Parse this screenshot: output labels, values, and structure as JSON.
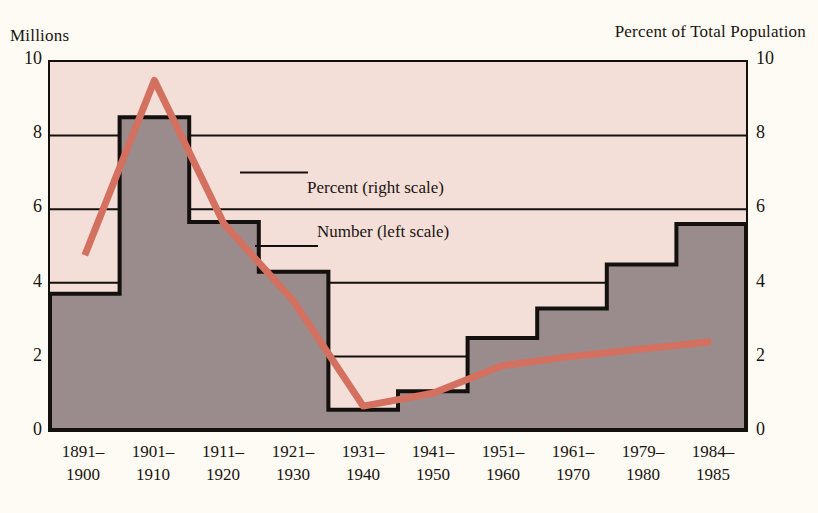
{
  "axes": {
    "left_title": "Millions",
    "right_title": "Percent of Total Population",
    "left_ticks": [
      "10",
      "8",
      "6",
      "4",
      "2",
      "0"
    ],
    "right_ticks": [
      "10",
      "8",
      "6",
      "4",
      "2",
      "0"
    ]
  },
  "legend": {
    "percent_label": "Percent (right scale)",
    "number_label": "Number (left scale)"
  },
  "colors": {
    "plot_background": "#f3ded8",
    "area_fill": "#9a8c8c",
    "area_outline": "#14100d",
    "percent_line": "#d4705f",
    "axis_line": "#14100d",
    "gridline": "#14100d",
    "page_background": "#fdfbf4",
    "text": "#1a1410"
  },
  "xlabels": [
    {
      "top": "1891–",
      "bottom": "1900"
    },
    {
      "top": "1901–",
      "bottom": "1910"
    },
    {
      "top": "1911–",
      "bottom": "1920"
    },
    {
      "top": "1921–",
      "bottom": "1930"
    },
    {
      "top": "1931–",
      "bottom": "1940"
    },
    {
      "top": "1941–",
      "bottom": "1950"
    },
    {
      "top": "1951–",
      "bottom": "1960"
    },
    {
      "top": "1961–",
      "bottom": "1970"
    },
    {
      "top": "1979–",
      "bottom": "1980"
    },
    {
      "top": "1984–",
      "bottom": "1985"
    }
  ],
  "chart_data": {
    "type": "area",
    "title": "",
    "subtitle": "",
    "xlabel": "",
    "ylabel": "Millions",
    "y2label": "Percent of Total Population",
    "ylim": [
      0,
      10
    ],
    "y2lim": [
      0,
      10
    ],
    "yticks": [
      0,
      2,
      4,
      6,
      8,
      10
    ],
    "y2ticks": [
      0,
      2,
      4,
      6,
      8,
      10
    ],
    "grid": true,
    "grid_axis": "y",
    "legend_position": "inside-center",
    "categories": [
      "1891-1900",
      "1901-1910",
      "1911-1920",
      "1921-1930",
      "1931-1940",
      "1941-1950",
      "1951-1960",
      "1961-1970",
      "1979-1980",
      "1984-1985"
    ],
    "series": [
      {
        "name": "Number (left scale)",
        "axis": "left",
        "units": "millions",
        "render": "step-area",
        "values": [
          3.7,
          8.5,
          5.65,
          4.3,
          0.55,
          1.05,
          2.5,
          3.3,
          4.5,
          5.6
        ]
      },
      {
        "name": "Percent (right scale)",
        "axis": "right",
        "units": "percent of total population",
        "render": "line",
        "values": [
          4.75,
          9.5,
          5.6,
          3.5,
          0.65,
          1.0,
          1.75,
          2.0,
          2.2,
          2.4
        ],
        "line_ends_at_category": "1979-1980"
      }
    ],
    "annotations": [
      {
        "text": "Percent (right scale)",
        "kind": "legend-callout"
      },
      {
        "text": "Number (left scale)",
        "kind": "legend-callout"
      }
    ]
  }
}
